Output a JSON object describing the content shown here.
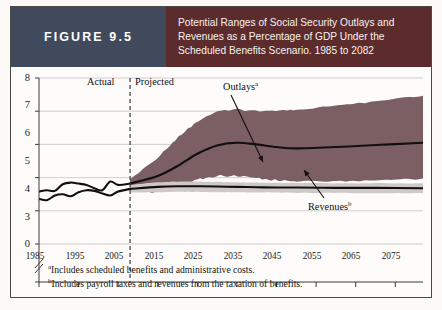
{
  "figure": {
    "badge_label": "FIGURE 9.5",
    "badge_color": "#41495c",
    "title_color": "#5c2b2b",
    "title_lines": [
      "Potential Ranges of Social Security Outlays and",
      "Revenues as a Percentage of GDP Under the",
      "Scheduled Benefits Scenario. 1985 to 2082"
    ]
  },
  "footnotes": [
    {
      "marker": "a",
      "text": "Includes scheduled benefits and administrative costs."
    },
    {
      "marker": "b",
      "text": "Includes payroll taxes and revenues from the taxation of benefits."
    }
  ],
  "chart_data": {
    "type": "area",
    "title": "Potential Ranges of Social Security Outlays and Revenues as a Percentage of GDP Under the Scheduled Benefits Scenario. 1985 to 2082",
    "xlabel": "",
    "ylabel": "",
    "grid": true,
    "legend_position": "inline-annotations",
    "xlim": [
      1985,
      2082
    ],
    "ylim": [
      3,
      8
    ],
    "y_axis_break_below": 3,
    "y_zero_shown": true,
    "yticks": [
      0,
      3,
      4,
      5,
      6,
      7,
      8
    ],
    "ytick_labels": [
      "0",
      "3",
      "4",
      "5",
      "6",
      "7",
      "8"
    ],
    "xticks": [
      1985,
      1995,
      2005,
      2015,
      2025,
      2035,
      2045,
      2055,
      2065,
      2075
    ],
    "xtick_labels": [
      "1985",
      "1995",
      "2005",
      "2015",
      "2025",
      "2035",
      "2045",
      "2055",
      "2065",
      "2075"
    ],
    "divider": {
      "x": 2008,
      "style": "dashed",
      "left_label": "Actual",
      "right_label": "Projected"
    },
    "annotations": [
      {
        "label": "Outlays",
        "sup": "a",
        "points_to": "outlays-line"
      },
      {
        "label": "Revenues",
        "sup": "b",
        "points_to": "revenues-line"
      }
    ],
    "colors": {
      "outlays_band": "#7c5f62",
      "revenues_band": "#cfc8c6",
      "line": "#101010",
      "grid": "#c9c9c9"
    },
    "series": [
      {
        "name": "Outlays (actual)",
        "kind": "line",
        "x": [
          1985,
          1987,
          1989,
          1991,
          1993,
          1995,
          1997,
          1999,
          2001,
          2003,
          2005,
          2008
        ],
        "values": [
          4.58,
          4.62,
          4.6,
          4.8,
          4.85,
          4.82,
          4.78,
          4.68,
          4.62,
          4.88,
          4.78,
          4.82
        ]
      },
      {
        "name": "Revenues (actual)",
        "kind": "line",
        "x": [
          1985,
          1987,
          1989,
          1991,
          1993,
          1995,
          1997,
          1999,
          2001,
          2003,
          2005,
          2008
        ],
        "values": [
          4.36,
          4.32,
          4.46,
          4.5,
          4.44,
          4.56,
          4.62,
          4.6,
          4.52,
          4.46,
          4.58,
          4.66
        ]
      },
      {
        "name": "Outlays (projected median)",
        "kind": "line",
        "x": [
          2008,
          2015,
          2020,
          2025,
          2030,
          2035,
          2040,
          2045,
          2050,
          2060,
          2070,
          2082
        ],
        "values": [
          4.82,
          5.05,
          5.35,
          5.72,
          5.97,
          6.05,
          6.0,
          5.92,
          5.88,
          5.92,
          5.98,
          6.05
        ]
      },
      {
        "name": "Revenues (projected median)",
        "kind": "line",
        "x": [
          2008,
          2015,
          2020,
          2025,
          2030,
          2035,
          2040,
          2045,
          2050,
          2060,
          2070,
          2082
        ],
        "values": [
          4.66,
          4.72,
          4.74,
          4.74,
          4.73,
          4.72,
          4.71,
          4.7,
          4.7,
          4.69,
          4.69,
          4.68
        ]
      },
      {
        "name": "Outlays range (upper bound)",
        "kind": "band-upper",
        "x": [
          2008,
          2015,
          2020,
          2025,
          2030,
          2035,
          2040,
          2045,
          2050,
          2060,
          2070,
          2082
        ],
        "values": [
          4.95,
          5.6,
          6.2,
          6.7,
          7.0,
          7.05,
          7.0,
          7.0,
          7.05,
          7.15,
          7.3,
          7.45
        ]
      },
      {
        "name": "Outlays range (lower bound)",
        "kind": "band-lower",
        "x": [
          2008,
          2015,
          2020,
          2025,
          2030,
          2035,
          2040,
          2045,
          2050,
          2060,
          2070,
          2082
        ],
        "values": [
          4.6,
          4.55,
          4.7,
          4.95,
          5.05,
          5.05,
          4.98,
          4.92,
          4.9,
          4.9,
          4.92,
          4.95
        ]
      },
      {
        "name": "Revenues range (upper bound)",
        "kind": "band-upper",
        "x": [
          2008,
          2015,
          2020,
          2025,
          2030,
          2035,
          2040,
          2045,
          2050,
          2060,
          2070,
          2082
        ],
        "values": [
          4.78,
          4.86,
          4.88,
          4.88,
          4.87,
          4.86,
          4.85,
          4.84,
          4.84,
          4.83,
          4.83,
          4.82
        ]
      },
      {
        "name": "Revenues range (lower bound)",
        "kind": "band-lower",
        "x": [
          2008,
          2015,
          2020,
          2025,
          2030,
          2035,
          2040,
          2045,
          2050,
          2060,
          2070,
          2082
        ],
        "values": [
          4.55,
          4.56,
          4.57,
          4.57,
          4.56,
          4.56,
          4.55,
          4.55,
          4.54,
          4.54,
          4.53,
          4.53
        ]
      }
    ]
  }
}
